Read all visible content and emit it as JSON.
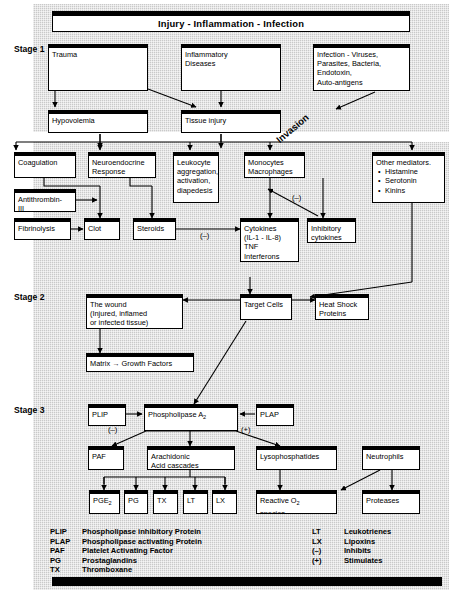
{
  "title": "Injury - Inflammation - Infection",
  "stages": [
    {
      "label": "Stage 1"
    },
    {
      "label": "Stage 2"
    },
    {
      "label": "Stage 3"
    }
  ],
  "stage1": {
    "trauma": "Trauma",
    "inflammatory_diseases": "Inflammatory\nDiseases",
    "infection": "Infection - Viruses,\nParasites, Bacteria,\nEndotoxin,\nAuto-antigens",
    "hypovolemia": "Hypovolemia",
    "tissue_injury": "Tissue injury",
    "invasion": "Invasion"
  },
  "mediator_row": {
    "coagulation": "Coagulation",
    "neuroendocrine": "Neuroendocrine\nResponse",
    "leukocyte": "Leukocyte\naggregation,\nactivation,\ndiapedesis",
    "monocytes": "Monocytes\nMacrophages",
    "other_mediators_title": "Other mediators.",
    "other_mediators_items": [
      "Histamine",
      "Serotonin",
      "Kinins"
    ]
  },
  "second_row": {
    "antithrombin": "Antithrombin-\nIII",
    "fibrinolysis": "Fibrinolysis",
    "clot": "Clot",
    "steroids": "Steroids",
    "cytokines": "Cytokines\n(IL-1 - IL-8)\nTNF\nInterferons",
    "inhibitory_cytokines": "Inhibitory\ncytokines",
    "steroids_sign": "(–)",
    "inhibitory_sign": "(–)"
  },
  "stage2": {
    "the_wound": "The wound\n(Injured, inflamed\nor infected tissue)",
    "matrix": "Matrix → Growth Factors",
    "target_cells": "Target Cells",
    "heat_shock": "Heat Shock\nProteins"
  },
  "stage3": {
    "plip": "PLIP",
    "phospholipase": "Phospholipase A",
    "phospholipase_sub": "2",
    "plap": "PLAP",
    "plip_sign": "(–)",
    "plap_sign": "(+)",
    "paf": "PAF",
    "arachidonic": "Arachidonic\nAcid cascades",
    "lysophosphatides": "Lysophosphatides",
    "neutrophils": "Neutrophils",
    "pge2": "PGE",
    "pge2_sub": "2",
    "pg": "PG",
    "tx": "TX",
    "lt": "LT",
    "lx": "LX",
    "reactive_o2": "Reactive O",
    "reactive_o2_sub": "2",
    "reactive_o2_tail": "species",
    "proteases": "Proteases"
  },
  "legend": {
    "left": [
      {
        "abbr": "PLIP",
        "defn": "Phospholipase inhibitory Protein"
      },
      {
        "abbr": "PLAP",
        "defn": "Phospholipase activating Protein"
      },
      {
        "abbr": "PAF",
        "defn": "Platelet Activating Factor"
      },
      {
        "abbr": "PG",
        "defn": "Prostaglandins"
      },
      {
        "abbr": "TX",
        "defn": "Thromboxane"
      }
    ],
    "right": [
      {
        "abbr": "LT",
        "defn": "Leukotrienes"
      },
      {
        "abbr": "LX",
        "defn": "Lipoxins"
      },
      {
        "abbr": "(–)",
        "defn": "Inhibits"
      },
      {
        "abbr": "(+)",
        "defn": "Stimulates"
      }
    ]
  },
  "colors": {
    "background": "#c9c9c9",
    "box_fill": "#ffffff",
    "stroke": "#000000"
  }
}
